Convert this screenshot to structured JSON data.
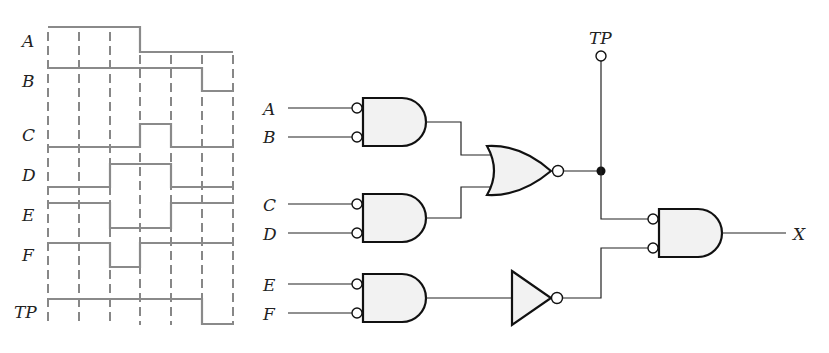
{
  "timing_diagram": {
    "signals": [
      {
        "name": "A",
        "label_y": 47,
        "levels": [
          1,
          1,
          1,
          0,
          0,
          0
        ]
      },
      {
        "name": "B",
        "label_y": 87,
        "levels": [
          1,
          1,
          1,
          1,
          1,
          0
        ]
      },
      {
        "name": "C",
        "label_y": 141,
        "levels": [
          0,
          0,
          0,
          1,
          0,
          0
        ]
      },
      {
        "name": "D",
        "label_y": 181,
        "levels": [
          0,
          0,
          1,
          1,
          0,
          0
        ]
      },
      {
        "name": "E",
        "label_y": 221,
        "levels": [
          1,
          1,
          0,
          0,
          1,
          1
        ]
      },
      {
        "name": "F",
        "label_y": 261,
        "levels": [
          1,
          1,
          0,
          1,
          1,
          1
        ]
      },
      {
        "name": "TP",
        "label_y": 318,
        "levels": [
          1,
          1,
          1,
          1,
          1,
          0
        ]
      }
    ],
    "time_intervals": 6
  },
  "circuit": {
    "inputs": [
      "A",
      "B",
      "C",
      "D",
      "E",
      "F"
    ],
    "test_point_label": "TP",
    "output_label": "X",
    "gates": [
      {
        "id": "g1",
        "type": "AND",
        "inverted_inputs": [
          "A",
          "B"
        ]
      },
      {
        "id": "g2",
        "type": "AND",
        "inverted_inputs": [
          "C",
          "D"
        ]
      },
      {
        "id": "g3",
        "type": "AND",
        "inverted_inputs": [
          "E",
          "F"
        ]
      },
      {
        "id": "g4",
        "type": "NOR",
        "inputs": [
          "g1",
          "g2"
        ]
      },
      {
        "id": "g5",
        "type": "NOT",
        "inputs": [
          "g3"
        ]
      },
      {
        "id": "g6",
        "type": "AND",
        "inverted_inputs": [
          "g4",
          "g5"
        ],
        "output": "X"
      }
    ]
  }
}
